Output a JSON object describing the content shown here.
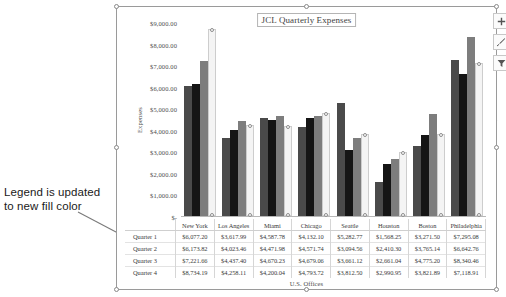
{
  "annotation": {
    "text": "Legend is updated to new fill color"
  },
  "chart": {
    "title": "JCL Quarterly Expenses",
    "buttons": [
      {
        "name": "chart-elements-button",
        "label": "+"
      },
      {
        "name": "chart-styles-button",
        "label": "Chart Styles"
      },
      {
        "name": "chart-filters-button",
        "label": "Chart Filters"
      }
    ]
  },
  "chart_data": {
    "type": "bar",
    "title": "JCL Quarterly Expenses",
    "xlabel": "U.S. Offices",
    "ylabel": "Expenses",
    "ylim": [
      0,
      9000
    ],
    "ytick_labels": [
      "$9,000.00",
      "$8,000.00",
      "$7,000.00",
      "$6,000.00",
      "$5,000.00",
      "$4,000.00",
      "$3,000.00",
      "$2,000.00",
      "$1,000.00",
      "$-"
    ],
    "ytick_values": [
      9000,
      8000,
      7000,
      6000,
      5000,
      4000,
      3000,
      2000,
      1000,
      0
    ],
    "grid": false,
    "legend_position": "data-table",
    "categories": [
      "New York",
      "Los Angeles",
      "Miami",
      "Chicago",
      "Seattle",
      "Houston",
      "Boston",
      "Philadelphia"
    ],
    "series": [
      {
        "name": "Quarter 1",
        "color": "#4a4a4a",
        "values": [
          6077.2,
          3617.99,
          4587.78,
          4132.1,
          5282.77,
          1568.25,
          3271.5,
          7295.08
        ],
        "labels": [
          "$6,077.20",
          "$3,617.99",
          "$4,587.78",
          "$4,132.10",
          "$5,282.77",
          "$1,568.25",
          "$3,271.50",
          "$7,295.08"
        ]
      },
      {
        "name": "Quarter 2",
        "color": "#151515",
        "values": [
          6173.82,
          4023.46,
          4471.98,
          4571.74,
          3094.56,
          2410.3,
          3765.14,
          6642.76
        ],
        "labels": [
          "$6,173.82",
          "$4,023.46",
          "$4,471.98",
          "$4,571.74",
          "$3,094.56",
          "$2,410.30",
          "$3,765.14",
          "$6,642.76"
        ]
      },
      {
        "name": "Quarter 3",
        "color": "#7d7d7d",
        "values": [
          7221.66,
          4437.4,
          4670.23,
          4679.06,
          3661.12,
          2661.04,
          4775.2,
          8340.46
        ],
        "labels": [
          "$7,221.66",
          "$4,437.40",
          "$4,670.23",
          "$4,679.06",
          "$3,661.12",
          "$2,661.04",
          "$4,775.20",
          "$8,340.46"
        ]
      },
      {
        "name": "Quarter 4",
        "color": "#f4f4f4",
        "selected": true,
        "values": [
          8734.19,
          4258.11,
          4200.04,
          4793.72,
          3812.5,
          2990.95,
          3821.89,
          7118.91
        ],
        "labels": [
          "$8,734.19",
          "$4,258.11",
          "$4,200.04",
          "$4,793.72",
          "$3,812.50",
          "$2,990.95",
          "$3,821.89",
          "$7,118.91"
        ]
      }
    ]
  }
}
